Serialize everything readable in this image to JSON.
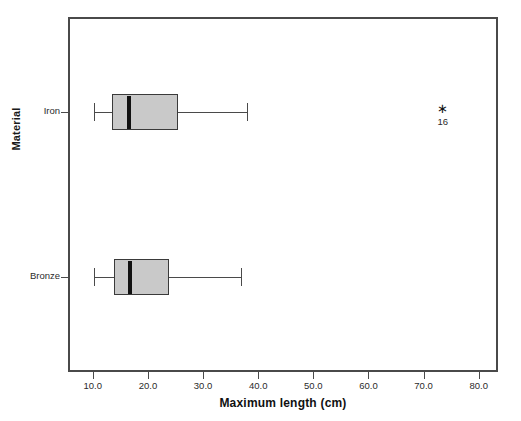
{
  "chart_data": {
    "type": "box",
    "title": "",
    "xlabel": "Maximum length (cm)",
    "ylabel": "Material",
    "orientation": "horizontal",
    "xlim": [
      5.5,
      83.5
    ],
    "xticks": [
      "10.0",
      "20.0",
      "30.0",
      "40.0",
      "50.0",
      "60.0",
      "70.0",
      "80.0"
    ],
    "xtick_values": [
      10,
      20,
      30,
      40,
      50,
      60,
      70,
      80
    ],
    "grid": false,
    "legend": "none",
    "categories": [
      "Iron",
      "Bronze"
    ],
    "boxes": [
      {
        "category": "Iron",
        "whisker_low": 10.2,
        "q1": 13.5,
        "median": 16.5,
        "q3": 25.5,
        "whisker_high": 38.0,
        "outliers": [
          {
            "value": 73.5,
            "label": "16",
            "marker": "star"
          }
        ]
      },
      {
        "category": "Bronze",
        "whisker_low": 10.2,
        "q1": 13.8,
        "median": 16.8,
        "q3": 23.8,
        "whisker_high": 36.8,
        "outliers": []
      }
    ],
    "colors": {
      "box_fill": "#c9c9c9",
      "box_edge": "#3a3a3a",
      "median": "#111111",
      "whisker": "#4a4a4a",
      "frame": "#4a4a4a",
      "background": "#ffffff"
    }
  }
}
